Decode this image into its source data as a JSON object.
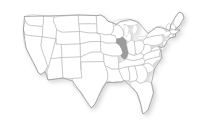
{
  "figure": {
    "type": "choropleth-map",
    "region": "United States",
    "background_color": "#ffffff",
    "border_color": "#b4b4b4",
    "outline_color": "#909090",
    "highlight_color": "#9c9c9c",
    "default_state_fill": "#ffffff",
    "shadow": "subtle drop shadow lower-right",
    "highlighted_states": [
      "Illinois"
    ],
    "title": "",
    "legend": "",
    "labels": []
  },
  "map": {
    "name": "us-states-map",
    "alt": "Map of the United States with Illinois shaded",
    "states": [
      {
        "code": "WA",
        "name": "Washington",
        "selected": false
      },
      {
        "code": "OR",
        "name": "Oregon",
        "selected": false
      },
      {
        "code": "CA",
        "name": "California",
        "selected": false
      },
      {
        "code": "NV",
        "name": "Nevada",
        "selected": false
      },
      {
        "code": "ID",
        "name": "Idaho",
        "selected": false
      },
      {
        "code": "MT",
        "name": "Montana",
        "selected": false
      },
      {
        "code": "WY",
        "name": "Wyoming",
        "selected": false
      },
      {
        "code": "UT",
        "name": "Utah",
        "selected": false
      },
      {
        "code": "AZ",
        "name": "Arizona",
        "selected": false
      },
      {
        "code": "CO",
        "name": "Colorado",
        "selected": false
      },
      {
        "code": "NM",
        "name": "New Mexico",
        "selected": false
      },
      {
        "code": "ND",
        "name": "North Dakota",
        "selected": false
      },
      {
        "code": "SD",
        "name": "South Dakota",
        "selected": false
      },
      {
        "code": "NE",
        "name": "Nebraska",
        "selected": false
      },
      {
        "code": "KS",
        "name": "Kansas",
        "selected": false
      },
      {
        "code": "OK",
        "name": "Oklahoma",
        "selected": false
      },
      {
        "code": "TX",
        "name": "Texas",
        "selected": false
      },
      {
        "code": "MN",
        "name": "Minnesota",
        "selected": false
      },
      {
        "code": "IA",
        "name": "Iowa",
        "selected": false
      },
      {
        "code": "MO",
        "name": "Missouri",
        "selected": false
      },
      {
        "code": "AR",
        "name": "Arkansas",
        "selected": false
      },
      {
        "code": "LA",
        "name": "Louisiana",
        "selected": false
      },
      {
        "code": "WI",
        "name": "Wisconsin",
        "selected": false
      },
      {
        "code": "IL",
        "name": "Illinois",
        "selected": true
      },
      {
        "code": "MI",
        "name": "Michigan",
        "selected": false
      },
      {
        "code": "IN",
        "name": "Indiana",
        "selected": false
      },
      {
        "code": "OH",
        "name": "Ohio",
        "selected": false
      },
      {
        "code": "KY",
        "name": "Kentucky",
        "selected": false
      },
      {
        "code": "TN",
        "name": "Tennessee",
        "selected": false
      },
      {
        "code": "MS",
        "name": "Mississippi",
        "selected": false
      },
      {
        "code": "AL",
        "name": "Alabama",
        "selected": false
      },
      {
        "code": "GA",
        "name": "Georgia",
        "selected": false
      },
      {
        "code": "FL",
        "name": "Florida",
        "selected": false
      },
      {
        "code": "SC",
        "name": "South Carolina",
        "selected": false
      },
      {
        "code": "NC",
        "name": "North Carolina",
        "selected": false
      },
      {
        "code": "VA",
        "name": "Virginia",
        "selected": false
      },
      {
        "code": "WV",
        "name": "West Virginia",
        "selected": false
      },
      {
        "code": "MD",
        "name": "Maryland",
        "selected": false
      },
      {
        "code": "DE",
        "name": "Delaware",
        "selected": false
      },
      {
        "code": "PA",
        "name": "Pennsylvania",
        "selected": false
      },
      {
        "code": "NJ",
        "name": "New Jersey",
        "selected": false
      },
      {
        "code": "NY",
        "name": "New York",
        "selected": false
      },
      {
        "code": "CT",
        "name": "Connecticut",
        "selected": false
      },
      {
        "code": "RI",
        "name": "Rhode Island",
        "selected": false
      },
      {
        "code": "MA",
        "name": "Massachusetts",
        "selected": false
      },
      {
        "code": "VT",
        "name": "Vermont",
        "selected": false
      },
      {
        "code": "NH",
        "name": "New Hampshire",
        "selected": false
      },
      {
        "code": "ME",
        "name": "Maine",
        "selected": false
      }
    ]
  }
}
